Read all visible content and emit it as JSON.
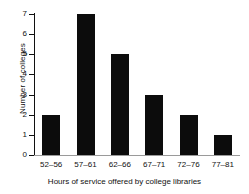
{
  "chart_data": {
    "type": "bar",
    "title": "",
    "categories": [
      "52–56",
      "57–61",
      "62–66",
      "67–71",
      "72–76",
      "77–81"
    ],
    "values": [
      2,
      7,
      5,
      3,
      2,
      1
    ],
    "xlabel": "Hours of service offered by college libraries",
    "ylabel": "Number of colleges",
    "ylim": [
      0,
      7
    ],
    "yticks": [
      0,
      1,
      2,
      3,
      4,
      5,
      6,
      7
    ],
    "ytick_labels": [
      "0",
      "1",
      "2",
      "3",
      "4",
      "5",
      "6",
      "7"
    ],
    "grid": false,
    "legend": null,
    "bar_color": "#0c0c0c",
    "axis_color": "#111111"
  }
}
